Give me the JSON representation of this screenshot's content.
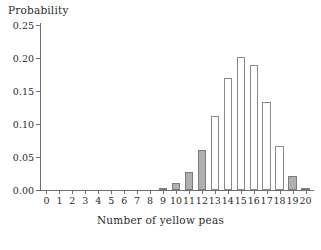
{
  "chart_data": {
    "type": "bar",
    "title": "",
    "subtitle": "",
    "xlabel": "Number of yellow peas",
    "ylabel": "Probability",
    "categories": [
      "0",
      "1",
      "2",
      "3",
      "4",
      "5",
      "6",
      "7",
      "8",
      "9",
      "10",
      "11",
      "12",
      "13",
      "14",
      "15",
      "16",
      "17",
      "18",
      "19",
      "20"
    ],
    "values": [
      0.0,
      0.0,
      0.0,
      0.0,
      0.0,
      0.0,
      0.0,
      0.0,
      0.0,
      0.003,
      0.01,
      0.027,
      0.061,
      0.112,
      0.169,
      0.202,
      0.19,
      0.134,
      0.067,
      0.021,
      0.003
    ],
    "bar_styles": [
      "filled",
      "filled",
      "filled",
      "filled",
      "filled",
      "filled",
      "filled",
      "filled",
      "filled",
      "filled",
      "filled",
      "filled",
      "filled",
      "hollow",
      "hollow",
      "hollow",
      "hollow",
      "hollow",
      "hollow",
      "filled",
      "filled"
    ],
    "ylim": [
      0.0,
      0.25
    ],
    "ytick_values": [
      0.0,
      0.05,
      0.1,
      0.15,
      0.2,
      0.25
    ],
    "ytick_labels": [
      "0.00",
      "0.05",
      "0.10",
      "0.15",
      "0.20",
      "0.25"
    ],
    "xtick_labels": [
      "0",
      "1",
      "2",
      "3",
      "4",
      "5",
      "6",
      "7",
      "8",
      "9",
      "10",
      "11",
      "12",
      "13",
      "14",
      "15",
      "16",
      "17",
      "18",
      "19",
      "20"
    ],
    "grid": false,
    "legend": null,
    "colors": {
      "bar_fill": "#b0b0b0",
      "bar_edge": "#8a8a8a",
      "hollow_fill": "#ffffff",
      "axis": "#6f6f6f",
      "text": "#2b2b2b",
      "background": "#ffffff"
    }
  }
}
